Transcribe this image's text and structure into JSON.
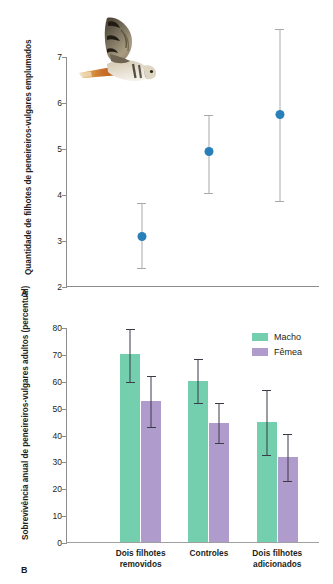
{
  "figure": {
    "panel_a_label": "A",
    "panel_b_label": "B"
  },
  "colors": {
    "point": "#2980b9",
    "error": "#a8a9ad",
    "macho": "#74cfae",
    "femea": "#b09bcd",
    "bar_error": "#3b3b46",
    "axis": "#8d8d8d"
  },
  "photo": {
    "subject": "kestrel-in-flight",
    "alt": "Peneireiro-vulgar em voo"
  },
  "legend": {
    "items": [
      {
        "label": "Macho",
        "color": "#74cfae"
      },
      {
        "label": "Fêmea",
        "color": "#b09bcd"
      }
    ]
  },
  "chart_data": [
    {
      "panel": "A",
      "type": "scatter",
      "title": "",
      "xlabel": "",
      "ylabel": "Quantidade de filhotes de peneireiros-vulgares emplumados",
      "ylim": [
        2,
        7
      ],
      "yticks": [
        2,
        3,
        4,
        5,
        6,
        7
      ],
      "yticklabels": [
        "2",
        "3",
        "4",
        "5",
        "6",
        "7"
      ],
      "grid": false,
      "error_type": "intervalo de confiança",
      "x": [
        1,
        2,
        3
      ],
      "xticklabels": [
        "",
        "",
        ""
      ],
      "values": [
        3.1,
        4.95,
        5.75
      ],
      "errors_low": [
        2.4,
        4.03,
        3.85
      ],
      "errors_high": [
        3.82,
        5.73,
        7.62
      ],
      "annotations": []
    },
    {
      "panel": "B",
      "type": "bar",
      "title": "",
      "xlabel": "",
      "ylabel": "Sobrevivência anual de peneireiros-vulgares adultos (percentual)",
      "ylim": [
        0,
        80
      ],
      "yticks": [
        0,
        10,
        20,
        30,
        40,
        50,
        60,
        70,
        80
      ],
      "yticklabels": [
        "0",
        "10",
        "20",
        "30",
        "40",
        "50",
        "60",
        "70",
        "80"
      ],
      "grid": false,
      "legend_position": "top-right",
      "categories": [
        "Dois filhotes\nremovidos",
        "Controles",
        "Dois filhotes\nadicionados"
      ],
      "series": [
        {
          "name": "Macho",
          "color": "#74cfae",
          "values": [
            70.0,
            60.0,
            44.5
          ],
          "errors_low": [
            59.5,
            51.7,
            32.3
          ],
          "errors_high": [
            79.8,
            68.6,
            56.8
          ]
        },
        {
          "name": "Fêmea",
          "color": "#b09bcd",
          "values": [
            52.5,
            44.3,
            31.6
          ],
          "errors_low": [
            42.9,
            36.8,
            22.7
          ],
          "errors_high": [
            62.2,
            52.1,
            40.6
          ]
        }
      ]
    }
  ]
}
